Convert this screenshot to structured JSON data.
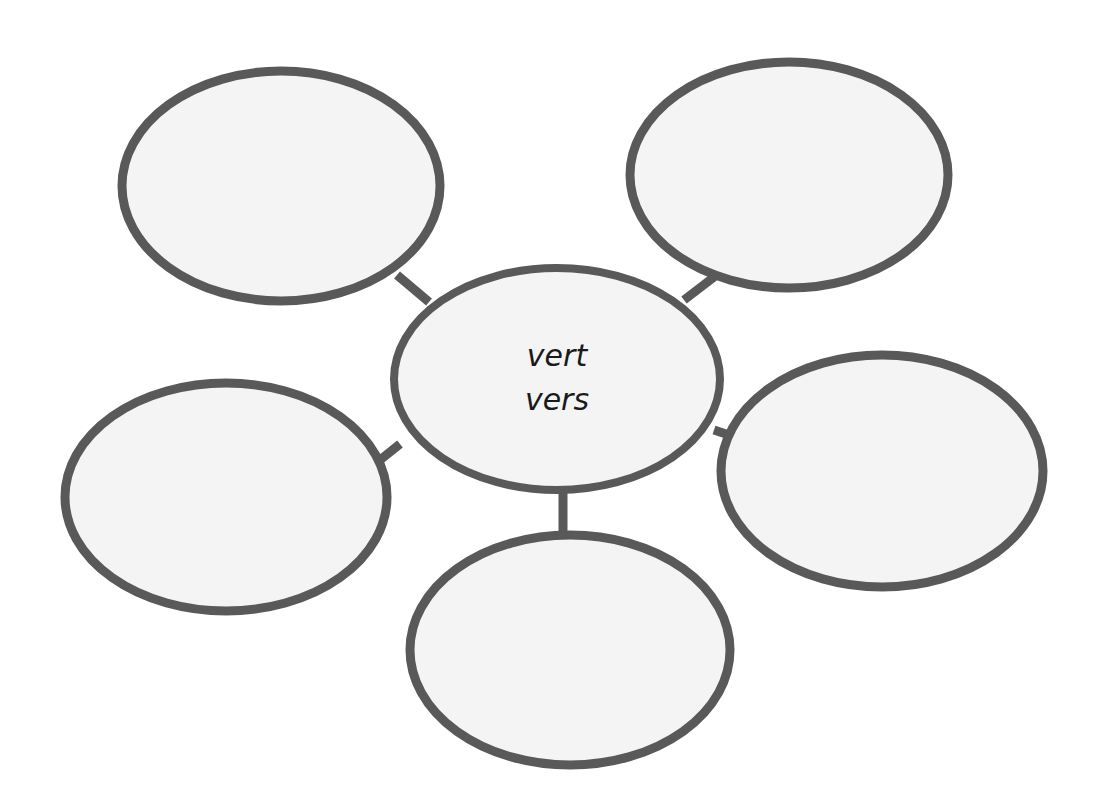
{
  "diagram": {
    "type": "word-web",
    "title": "",
    "background_color": "#ffffff",
    "shape_fill_color": "#f4f4f4",
    "shape_stroke_color": "#595959",
    "text_color": "#1a1a1a",
    "center": {
      "id": "center-node",
      "line1": "vert",
      "line2": "vers",
      "cx": 557,
      "cy": 379,
      "rx": 163,
      "ry": 111
    },
    "nodes": [
      {
        "id": "node-top-left",
        "label": "",
        "cx": 281,
        "cy": 186,
        "rx": 159,
        "ry": 115
      },
      {
        "id": "node-top-right",
        "label": "",
        "cx": 789,
        "cy": 175,
        "rx": 159,
        "ry": 113
      },
      {
        "id": "node-right",
        "label": "",
        "cx": 882,
        "cy": 471,
        "rx": 161,
        "ry": 116
      },
      {
        "id": "node-bottom",
        "label": "",
        "cx": 570,
        "cy": 650,
        "rx": 160,
        "ry": 115
      },
      {
        "id": "node-left",
        "label": "",
        "cx": 226,
        "cy": 497,
        "rx": 161,
        "ry": 114
      }
    ],
    "connectors": [
      {
        "id": "connector-center-top-left",
        "x1": 429,
        "y1": 302,
        "x2": 397,
        "y2": 275
      },
      {
        "id": "connector-center-top-right",
        "x1": 684,
        "y1": 300,
        "x2": 718,
        "y2": 274
      },
      {
        "id": "connector-center-right",
        "x1": 714,
        "y1": 430,
        "x2": 744,
        "y2": 440
      },
      {
        "id": "connector-center-bottom",
        "x1": 563,
        "y1": 487,
        "x2": 563,
        "y2": 538
      },
      {
        "id": "connector-center-left",
        "x1": 400,
        "y1": 444,
        "x2": 370,
        "y2": 468
      }
    ]
  }
}
